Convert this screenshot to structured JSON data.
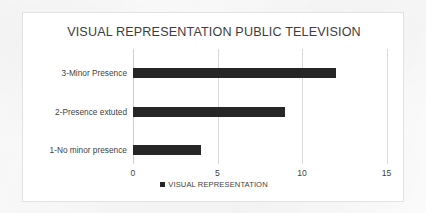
{
  "chart_data": {
    "type": "bar",
    "orientation": "horizontal",
    "title": "VISUAL REPRESENTATION PUBLIC TELEVISION",
    "categories": [
      "1-No minor presence",
      "2-Presence extuted",
      "3-Minor Presence"
    ],
    "values": [
      4,
      9,
      12
    ],
    "series": [
      {
        "name": "VISUAL REPRESENTATION",
        "values": [
          4,
          9,
          12
        ],
        "color": "#262626"
      }
    ],
    "xlabel": "",
    "ylabel": "",
    "xlim": [
      0,
      15
    ],
    "xticks": [
      "0",
      "5",
      "10",
      "15"
    ],
    "xtick_values": [
      0,
      5,
      10,
      15
    ],
    "grid": "vertical",
    "legend": {
      "position": "bottom",
      "entries": [
        {
          "label": "VISUAL REPRESENTATION",
          "color": "#262626"
        }
      ]
    }
  },
  "style": {
    "bar_color": "#262626",
    "gridline_color": "#d9d9d9",
    "frame_color": "#e2e2e2",
    "text_color": "#3f3f3f",
    "title_color": "#3d3d3d",
    "background": "#ffffff"
  }
}
